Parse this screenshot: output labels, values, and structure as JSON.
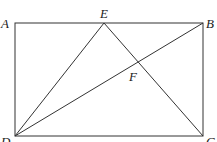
{
  "diagram": {
    "type": "geometry",
    "points": {
      "A": {
        "label": "A",
        "x": 15,
        "y": 23
      },
      "B": {
        "label": "B",
        "x": 203,
        "y": 23
      },
      "C": {
        "label": "C",
        "x": 203,
        "y": 136
      },
      "D": {
        "label": "D",
        "x": 15,
        "y": 136
      },
      "E": {
        "label": "E",
        "x": 104,
        "y": 23
      },
      "F": {
        "label": "F",
        "x": 139,
        "y": 61
      }
    },
    "segments": [
      "AB",
      "BC",
      "CD",
      "DA",
      "DE",
      "EC",
      "DB"
    ],
    "labels": {
      "A": "A",
      "B": "B",
      "C": "C",
      "D": "D",
      "E": "E",
      "F": "F"
    }
  }
}
